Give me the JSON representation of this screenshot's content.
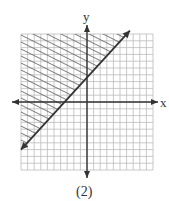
{
  "chart_data": {
    "type": "line",
    "title": "",
    "caption": "(2)",
    "xlabel": "x",
    "ylabel": "y",
    "xlim": [
      -10,
      10
    ],
    "ylim": [
      -10,
      10
    ],
    "grid": true,
    "series": [
      {
        "name": "boundary",
        "x": [
          -10,
          6.5
        ],
        "y": [
          -7,
          10.5
        ],
        "style": "solid"
      }
    ],
    "shaded_region": "above-left of boundary line",
    "colors": {
      "grid": "#bbbbbb",
      "axis": "#333333",
      "line": "#333333",
      "hatch": "#666666"
    }
  }
}
